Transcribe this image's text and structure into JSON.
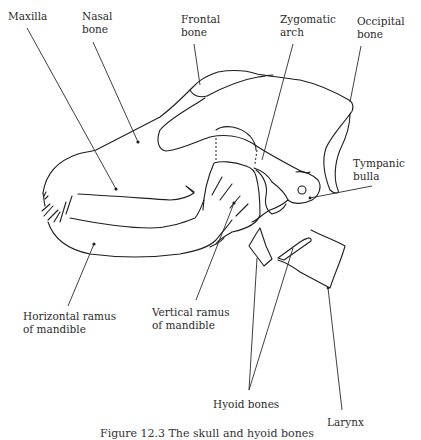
{
  "figure": {
    "caption": "Figure 12.3 The skull and hyoid bones",
    "labels": {
      "maxilla": [
        "Maxilla"
      ],
      "nasal_bone": [
        "Nasal",
        "bone"
      ],
      "frontal_bone": [
        "Frontal",
        "bone"
      ],
      "zygomatic_arch": [
        "Zygomatic",
        "arch"
      ],
      "occipital_bone": [
        "Occipital",
        "bone"
      ],
      "tympanic_bulla": [
        "Tympanic",
        "bulla"
      ],
      "horizontal_ramus": [
        "Horizontal ramus",
        "of mandible"
      ],
      "vertical_ramus": [
        "Vertical ramus",
        "of mandible"
      ],
      "hyoid_bones": [
        "Hyoid bones"
      ],
      "larynx": [
        "Larynx"
      ]
    },
    "colors": {
      "line": "#1e1e1e",
      "text": "#2b2b2b",
      "background": "#ffffff"
    }
  }
}
